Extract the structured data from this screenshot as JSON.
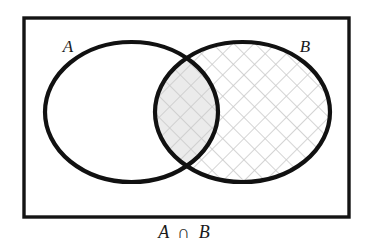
{
  "figure": {
    "kind": "venn-diagram",
    "caption": "A ∩ B",
    "caption_set_a": "A",
    "caption_operator": "∩",
    "caption_set_b": "B",
    "universe_label": "",
    "label_a": "A",
    "label_b": "B",
    "colors": {
      "background": "#ffffff",
      "outline": "#111111",
      "rectangle_border": "#141414",
      "hatch_line": "#c9c9c9",
      "intersection_fill": "#ebebeb",
      "text": "#1a1a1a"
    },
    "geometry": {
      "canvas_width": 369,
      "canvas_height": 244,
      "rect_x": 24,
      "rect_y": 18,
      "rect_width": 325,
      "rect_height": 199,
      "rect_stroke_width": 3.4,
      "circle_a_cx": 131.5,
      "circle_a_cy": 112,
      "circle_a_rx": 86.5,
      "circle_a_ry": 70,
      "circle_b_cx": 242.5,
      "circle_b_cy": 112,
      "circle_b_rx": 87.5,
      "circle_b_ry": 70,
      "circle_stroke_width": 4.2,
      "hatch_spacing": 15,
      "hatch_stroke_width": 1.6,
      "label_a_x": 68,
      "label_a_y": 52,
      "label_b_x": 305,
      "label_b_y": 52,
      "caption_x": 184,
      "caption_y": 238
    },
    "regions": [
      {
        "name": "a-only",
        "label": "A \\ B",
        "shaded": false,
        "hatched": false
      },
      {
        "name": "intersection",
        "label": "A ∩ B",
        "shaded": true,
        "hatched": true
      },
      {
        "name": "b-only",
        "label": "B \\ A",
        "shaded": false,
        "hatched": true
      },
      {
        "name": "universe-outside",
        "label": "U",
        "shaded": false,
        "hatched": false
      }
    ]
  }
}
